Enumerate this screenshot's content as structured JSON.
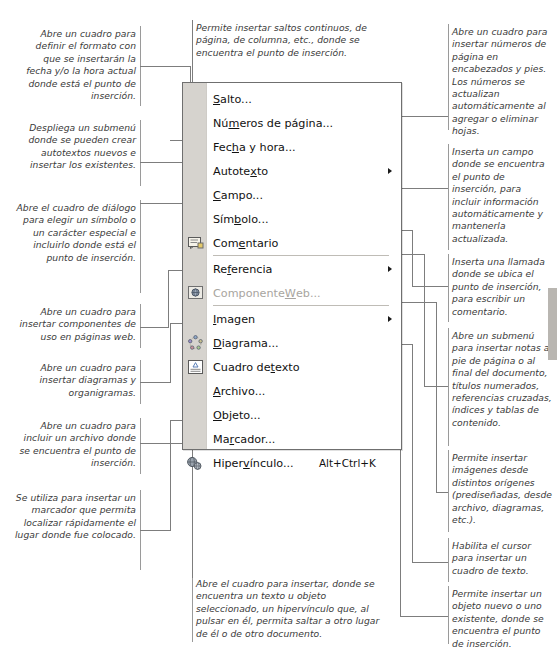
{
  "menu": {
    "title": "Insertar",
    "items": [
      {
        "id": "salto",
        "label": "Salto...",
        "accel": "a",
        "icon": null,
        "shortcut": "",
        "submenu": false,
        "disabled": false
      },
      {
        "id": "numeros-de-pagina",
        "label": "Números de página...",
        "accel": "m",
        "icon": null,
        "shortcut": "",
        "submenu": false,
        "disabled": false
      },
      {
        "id": "fecha-y-hora",
        "label": "Fecha y hora...",
        "accel": "h",
        "icon": null,
        "shortcut": "",
        "submenu": false,
        "disabled": false
      },
      {
        "id": "autotexto",
        "label": "Autotexto",
        "accel": "x",
        "icon": null,
        "shortcut": "",
        "submenu": true,
        "disabled": false
      },
      {
        "id": "campo",
        "label": "Campo...",
        "accel": "C",
        "icon": null,
        "shortcut": "",
        "submenu": false,
        "disabled": false
      },
      {
        "id": "simbolo",
        "label": "Símbolo...",
        "accel": "b",
        "icon": null,
        "shortcut": "",
        "submenu": false,
        "disabled": false
      },
      {
        "id": "comentario",
        "label": "Comentario",
        "accel": "e",
        "icon": "comment-icon",
        "shortcut": "",
        "submenu": false,
        "disabled": false
      },
      {
        "id": "referencia",
        "label": "Referencia",
        "accel": "f",
        "icon": null,
        "shortcut": "",
        "submenu": true,
        "disabled": false
      },
      {
        "id": "componente-web",
        "label": "Componente Web...",
        "accel": "W",
        "icon": "web-component-icon",
        "shortcut": "",
        "submenu": false,
        "disabled": true
      },
      {
        "id": "imagen",
        "label": "Imagen",
        "accel": "I",
        "icon": null,
        "shortcut": "",
        "submenu": true,
        "disabled": false
      },
      {
        "id": "diagrama",
        "label": "Diagrama...",
        "accel": "D",
        "icon": "diagram-icon",
        "shortcut": "",
        "submenu": false,
        "disabled": false
      },
      {
        "id": "cuadro-de-texto",
        "label": "Cuadro de texto",
        "accel": "t",
        "icon": "textbox-icon",
        "shortcut": "",
        "submenu": false,
        "disabled": false
      },
      {
        "id": "archivo",
        "label": "Archivo...",
        "accel": "A",
        "icon": null,
        "shortcut": "",
        "submenu": false,
        "disabled": false
      },
      {
        "id": "objeto",
        "label": "Objeto...",
        "accel": "O",
        "icon": null,
        "shortcut": "",
        "submenu": false,
        "disabled": false
      },
      {
        "id": "marcador",
        "label": "Marcador...",
        "accel": "r",
        "icon": null,
        "shortcut": "",
        "submenu": false,
        "disabled": false
      },
      {
        "id": "hipervinculo",
        "label": "Hipervínculo...",
        "accel": "v",
        "icon": "hyperlink-icon",
        "shortcut": "Alt+Ctrl+K",
        "submenu": false,
        "disabled": false
      }
    ]
  },
  "annotations": {
    "fecha_hora": "Abre un cuadro para definir el formato con que se insertarán la fecha y/o la hora actual donde está el punto de inserción.",
    "autotexto": "Despliega un submenú donde se pueden crear autotextos nuevos e insertar los existentes.",
    "simbolo": "Abre el cuadro de diálogo para elegir un símbolo o un carácter especial e incluirlo donde está el punto de inserción.",
    "componente_web": "Abre un cuadro para insertar componentes de uso en páginas web.",
    "diagrama": "Abre un cuadro para insertar diagramas y organigramas.",
    "archivo": "Abre un cuadro para incluir un archivo donde se encuentra el punto de inserción.",
    "marcador": "Se utiliza para insertar un marcador que permita localizar rápidamente el lugar donde fue colocado.",
    "salto": "Permite insertar saltos continuos, de página, de columna, etc., donde se encuentra el punto de inserción.",
    "hipervinculo": "Abre el cuadro para insertar, donde se encuentra un texto u objeto seleccionado, un hipervínculo que, al pulsar en él, permita saltar a otro lugar de él o de otro documento.",
    "numeros_pagina": "Abre un cuadro para insertar números de página en encabezados y pies. Los números se actualizan automáticamente al agregar o eliminar hojas.",
    "campo": "Inserta un campo donde se encuentra el punto de inserción, para incluir información automáticamente y mantenerla actualizada.",
    "comentario": "Inserta una llamada donde se ubica el punto de inserción, para escribir un comentario.",
    "referencia": "Abre un submenú para insertar notas a pie de página o al final del documento, títulos numerados, referencias cruzadas, índices y tablas de contenido.",
    "imagen": "Permite insertar imágenes desde distintos orígenes (prediseñadas, desde archivo, diagramas, etc.).",
    "cuadro_texto": "Habilita el cursor para insertar un cuadro de texto.",
    "objeto": "Permite insertar un objeto nuevo o uno existente, donde se encuentra el punto de inserción."
  },
  "colors": {
    "menu_bg": "#ffffff",
    "menu_border": "#6f6f6f",
    "gutter": "#d6d3ce",
    "disabled_text": "#a8a5a0",
    "leader_line": "#7d7d7d",
    "anno_text": "#3a3a3a"
  }
}
